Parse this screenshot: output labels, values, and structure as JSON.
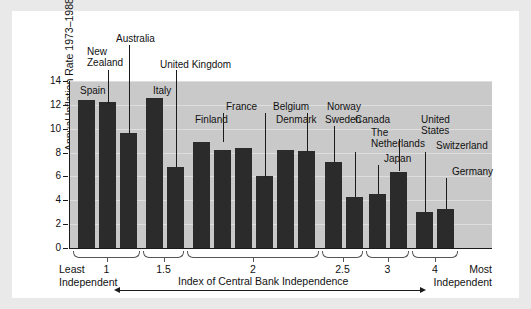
{
  "chart_data": {
    "type": "bar",
    "title": "",
    "ylabel": "Annual Inflation Rate 1973–1988 (%)",
    "xlabel": "Index of Central Bank Independence",
    "ylim": [
      0,
      14
    ],
    "yticks": [
      "0",
      "2",
      "4",
      "6",
      "8",
      "10",
      "12",
      "14"
    ],
    "grid": true,
    "legend": "none",
    "categories": [
      "Spain",
      "New Zealand",
      "Australia",
      "Italy",
      "United Kingdom",
      "Finland",
      "France",
      "Denmark",
      "Belgium",
      "Sweden",
      "Norway",
      "Canada",
      "The Netherlands",
      "Japan",
      "United States",
      "Switzerland",
      "Germany"
    ],
    "values": [
      12.4,
      12.2,
      9.6,
      12.6,
      6.8,
      8.9,
      8.2,
      8.4,
      6.0,
      8.2,
      8.1,
      7.2,
      4.3,
      4.5,
      6.4,
      3.0,
      3.3
    ],
    "group_index": [
      1,
      1,
      1,
      1.5,
      1.5,
      2,
      2,
      2,
      2,
      2,
      2,
      2.5,
      2.5,
      3,
      3,
      4,
      4
    ],
    "group_ticks": [
      "1",
      "1.5",
      "2",
      "2.5",
      "3",
      "4"
    ],
    "annotations": {
      "left_note": "Least\nIndependent",
      "right_note": "Most\nIndependent"
    }
  },
  "axis": {
    "ylabel": "Annual Inflation Rate 1973–1988 (%)",
    "yticks": [
      "14",
      "12",
      "10",
      "8",
      "6",
      "4",
      "2",
      "0"
    ],
    "xtitle": "Index of Central Bank Independence",
    "group_labels": [
      "1",
      "1.5",
      "2",
      "2.5",
      "3",
      "4"
    ],
    "least_note": "Least\nIndependent",
    "most_note": "Most\nIndependent"
  },
  "bar_labels": {
    "spain": "Spain",
    "new_zealand": "New\nZealand",
    "australia": "Australia",
    "italy": "Italy",
    "united_kingdom": "United Kingdom",
    "finland": "Finland",
    "france": "France",
    "denmark": "Denmark",
    "belgium": "Belgium",
    "sweden": "Sweden",
    "norway": "Norway",
    "canada": "Canada",
    "netherlands": "The\nNetherlands",
    "japan": "Japan",
    "united_states": "United\nStates",
    "switzerland": "Switzerland",
    "germany": "Germany"
  },
  "colors": {
    "bar": "#2b2b2b",
    "plot_background": "#c9c9c9",
    "gridline": "#dedede",
    "page_background": "#e9e9e9",
    "card_background": "#ffffff",
    "text": "#111111"
  }
}
